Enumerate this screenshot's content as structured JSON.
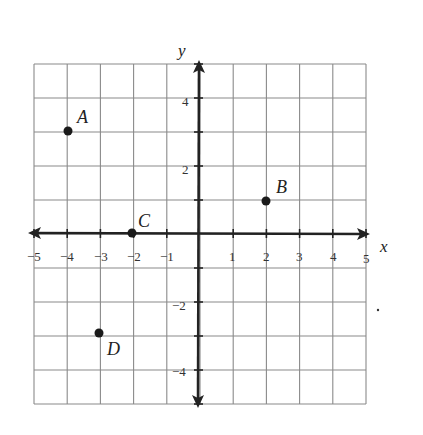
{
  "diagram": {
    "type": "coordinate-plane",
    "x_axis": {
      "label": "x",
      "min": -5,
      "max": 5,
      "tick_labels": [
        "−5",
        "−4",
        "−3",
        "−2",
        "−1",
        "1",
        "2",
        "3",
        "4",
        "5"
      ]
    },
    "y_axis": {
      "label": "y",
      "min": -5,
      "max": 5,
      "tick_labels": [
        "4",
        "2",
        "−2",
        "−4"
      ]
    },
    "points": [
      {
        "label": "A",
        "x": -4,
        "y": 3
      },
      {
        "label": "B",
        "x": 2,
        "y": 1
      },
      {
        "label": "C",
        "x": -2,
        "y": 0
      },
      {
        "label": "D",
        "x": -3,
        "y": -3
      }
    ],
    "colors": {
      "grid": "#8a8a8a",
      "axis": "#222222",
      "point": "#1a1a1a"
    }
  }
}
